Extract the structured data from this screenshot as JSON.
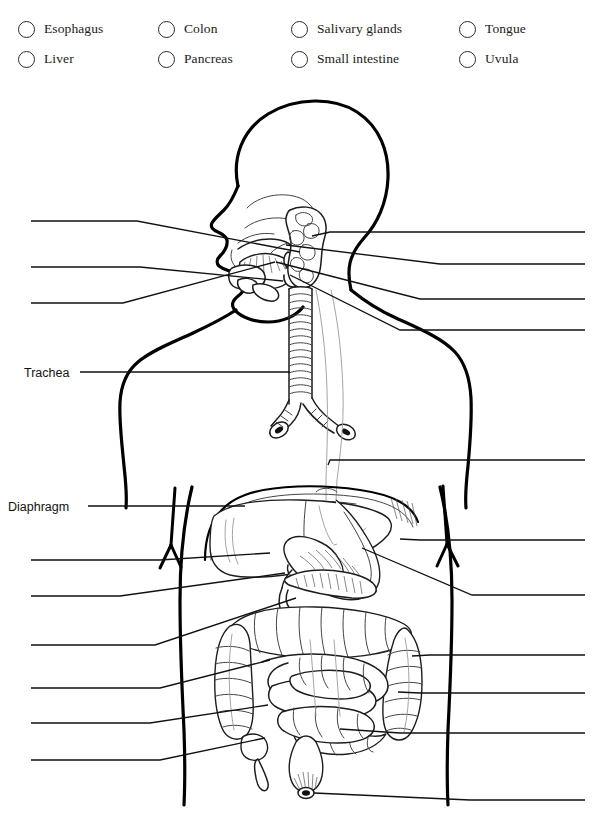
{
  "worksheet": {
    "title": "Digestive system labeling diagram",
    "subject": "human digestive system"
  },
  "word_bank": {
    "checkbox_icon": "circle-checkbox-empty",
    "items": [
      {
        "label": "Esophagus",
        "checked": false,
        "col": 1,
        "row": 1
      },
      {
        "label": "Liver",
        "checked": false,
        "col": 1,
        "row": 2
      },
      {
        "label": "Colon",
        "checked": false,
        "col": 2,
        "row": 1
      },
      {
        "label": "Pancreas",
        "checked": false,
        "col": 2,
        "row": 2
      },
      {
        "label": "Salivary glands",
        "checked": false,
        "col": 3,
        "row": 1
      },
      {
        "label": "Small intestine",
        "checked": false,
        "col": 3,
        "row": 2
      },
      {
        "label": "Tongue",
        "checked": false,
        "col": 4,
        "row": 1
      },
      {
        "label": "Uvula",
        "checked": false,
        "col": 4,
        "row": 2
      }
    ]
  },
  "prefilled_labels": [
    {
      "text": "Trachea",
      "x": 24,
      "y": 366
    },
    {
      "text": "Diaphragm",
      "x": 8,
      "y": 500
    }
  ],
  "answer_lines": {
    "note": "blank leader lines awaiting student answers",
    "left": [
      {
        "id": "left-1",
        "text": ""
      },
      {
        "id": "left-2",
        "text": ""
      },
      {
        "id": "left-3",
        "text": ""
      },
      {
        "id": "left-4",
        "text": ""
      },
      {
        "id": "left-5",
        "text": ""
      },
      {
        "id": "left-6",
        "text": ""
      },
      {
        "id": "left-7",
        "text": ""
      },
      {
        "id": "left-8",
        "text": ""
      },
      {
        "id": "left-9",
        "text": ""
      }
    ],
    "right": [
      {
        "id": "right-1",
        "text": ""
      },
      {
        "id": "right-2",
        "text": ""
      },
      {
        "id": "right-3",
        "text": ""
      },
      {
        "id": "right-4",
        "text": ""
      },
      {
        "id": "right-5",
        "text": ""
      },
      {
        "id": "right-6",
        "text": ""
      },
      {
        "id": "right-7",
        "text": ""
      },
      {
        "id": "right-8",
        "text": ""
      },
      {
        "id": "right-9",
        "text": ""
      },
      {
        "id": "right-10",
        "text": ""
      },
      {
        "id": "right-11",
        "text": ""
      }
    ]
  },
  "colors": {
    "ink": "#111111",
    "outline": "#000000",
    "paper": "#ffffff",
    "faint": "#9a9a9a"
  }
}
